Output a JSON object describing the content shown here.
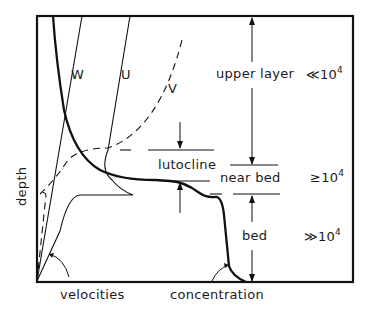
{
  "diagram": {
    "type": "depth profile schematic",
    "y_axis_label": "depth",
    "x_axis_labels": {
      "velocities": "velocities",
      "concentration": "concentration"
    },
    "curves": [
      {
        "id": "W",
        "label": "W",
        "style": "thin solid"
      },
      {
        "id": "U",
        "label": "U",
        "style": "thin solid"
      },
      {
        "id": "V",
        "label": "V",
        "style": "dashed"
      },
      {
        "id": "concentration",
        "label": "concentration",
        "style": "thick solid"
      }
    ],
    "layers": [
      {
        "name": "upper layer",
        "value_prefix": "≪10",
        "exponent": "4"
      },
      {
        "name": "lutocline",
        "value_prefix": "",
        "exponent": ""
      },
      {
        "name": "near bed",
        "value_prefix": "≥10",
        "exponent": "4"
      },
      {
        "name": "bed",
        "value_prefix": "≫10",
        "exponent": "4"
      }
    ]
  },
  "colors": {
    "ink": "#111111",
    "background": "#ffffff"
  }
}
